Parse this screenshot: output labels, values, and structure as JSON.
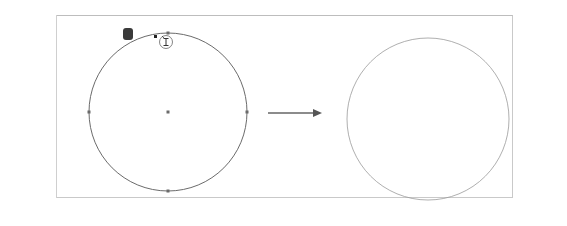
{
  "app": {
    "name": "Illustrator-style editor"
  },
  "toolbar": {
    "tools": [
      {
        "name": "selection-tool",
        "icon": "arrow-icon",
        "active": false
      },
      {
        "name": "direct-selection-tool",
        "icon": "hollow-arrow-icon",
        "active": false
      },
      {
        "name": "magic-wand-tool",
        "icon": "magic-wand-icon",
        "active": false
      },
      {
        "name": "lasso-tool",
        "icon": "lasso-icon",
        "active": false
      },
      {
        "name": "pen-tool",
        "icon": "pen-icon",
        "active": false
      },
      {
        "name": "curvature-tool",
        "icon": "curvature-pen-icon",
        "active": false
      },
      {
        "name": "type-tool",
        "icon": "type-on-path-icon",
        "active": true
      },
      {
        "name": "line-segment-tool",
        "icon": "line-icon",
        "active": false
      },
      {
        "name": "ellipse-tool",
        "icon": "ellipse-icon",
        "active": false
      },
      {
        "name": "paintbrush-tool",
        "icon": "brush-icon",
        "active": false
      },
      {
        "name": "shaper-tool",
        "icon": "shaper-icon",
        "active": false
      },
      {
        "name": "pencil-tool",
        "icon": "pencil-icon",
        "active": false
      },
      {
        "name": "rotate-tool",
        "icon": "rotate-icon",
        "active": false
      },
      {
        "name": "scale-tool",
        "icon": "scale-icon",
        "active": false
      },
      {
        "name": "puppet-warp-tool",
        "icon": "puppet-warp-icon",
        "active": false
      },
      {
        "name": "free-transform-tool",
        "icon": "free-transform-icon",
        "active": false
      },
      {
        "name": "shape-builder-tool",
        "icon": "shape-builder-icon",
        "active": false
      },
      {
        "name": "perspective-grid-tool",
        "icon": "perspective-grid-icon",
        "active": false
      },
      {
        "name": "mesh-tool",
        "icon": "mesh-icon",
        "active": false
      },
      {
        "name": "gradient-tool",
        "icon": "gradient-icon",
        "active": false
      },
      {
        "name": "eyedropper-tool",
        "icon": "eyedropper-icon",
        "active": false
      },
      {
        "name": "blend-tool",
        "icon": "blend-icon",
        "active": false
      },
      {
        "name": "symbol-sprayer-tool",
        "icon": "symbol-sprayer-icon",
        "active": false
      },
      {
        "name": "column-graph-tool",
        "icon": "bar-graph-icon",
        "active": false
      },
      {
        "name": "artboard-tool",
        "icon": "artboard-icon",
        "active": false
      },
      {
        "name": "slice-tool",
        "icon": "slice-knife-icon",
        "active": false
      }
    ]
  },
  "canvas": {
    "click_label": "클릭",
    "cursor": "type-cursor-icon",
    "arrow": "right-arrow-icon",
    "colors": {
      "path_stroke": "#6b6b6b",
      "text_highlight": "#111111",
      "badge_bg": "#3a3a3a"
    },
    "area_text_lines": [
      "Lorem ipsum dolor sit",
      "amet, consectetuer adipiscing",
      "elit, sed diam nonummy nibh",
      "euismod tincidunt ut laoreet dolore",
      "magna aliquam erat volutpat. Ut wisi enim",
      "ad minim veniam, quis nostrud exerci tation",
      "ullamcorper suscipit lobortis nisl ut aliquip ex",
      "ea commodo consequat. Duis autem vel eum",
      "iriure dolor in hendrerit in vulputate velit",
      "esse molestie consequat, vel illum dolore",
      "eu feugiat nulla facilisis at vero eros et",
      "accumsan et iusto odio dignissim qui",
      "blandit praesent luptatum zzril",
      "delenit augue duis",
      "dolore te"
    ]
  }
}
